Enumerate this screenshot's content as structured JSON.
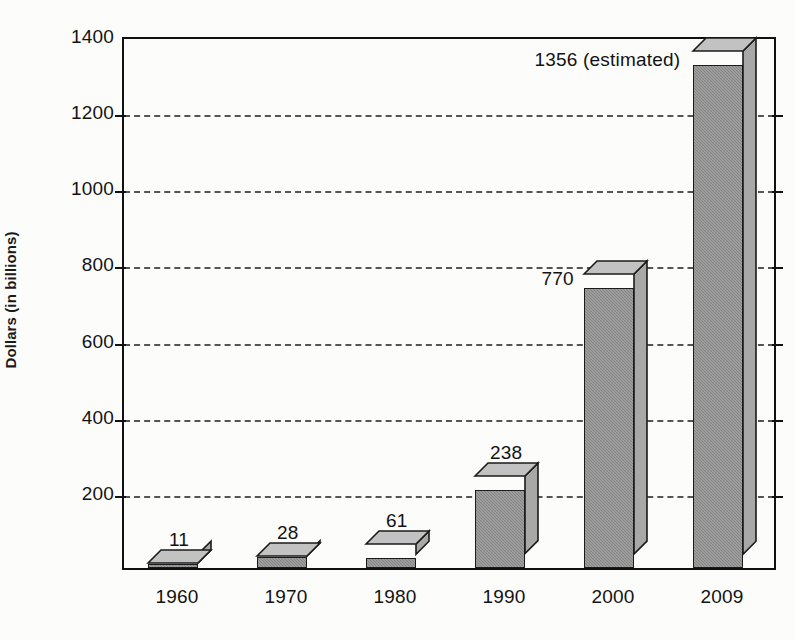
{
  "chart_data": {
    "type": "bar",
    "title": "",
    "subtitle": "",
    "xlabel": "",
    "ylabel": "Dollars (in billions)",
    "categories": [
      "1960",
      "1970",
      "1980",
      "1990",
      "2000",
      "2009"
    ],
    "values": [
      11,
      28,
      61,
      238,
      770,
      1356
    ],
    "value_labels": [
      "11",
      "28",
      "61",
      "238",
      "770",
      "1356 (estimated)"
    ],
    "ylim": [
      0,
      1400
    ],
    "ytick_values": [
      200,
      400,
      600,
      800,
      1000,
      1200,
      1400
    ],
    "ytick_labels": [
      "200",
      "400",
      "600",
      "800",
      "1000",
      "1200",
      "1400"
    ],
    "grid": "horizontal-dashed",
    "legend": "none",
    "style": "3d-bars-grayscale",
    "annotations": [
      "1356 (estimated)"
    ]
  },
  "colors": {
    "bar_front": "#8f8f8f",
    "bar_side": "#a8a8a8",
    "bar_top": "#c2c2c2",
    "outline": "#1b1b1b",
    "axis": "#111111",
    "gridline": "#555555",
    "text": "#131313",
    "background": "#fdfdfd"
  },
  "artifacts": {
    "top_cut_text": ""
  }
}
